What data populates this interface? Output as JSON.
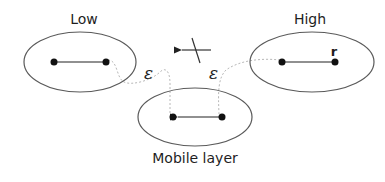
{
  "diagram": {
    "nodes": [
      {
        "id": "low",
        "label": "Low"
      },
      {
        "id": "high",
        "label": "High",
        "point_label": "r"
      },
      {
        "id": "mobile",
        "label": "Mobile layer"
      }
    ],
    "edge_labels": {
      "left": "ε",
      "right": "ε"
    },
    "colors": {
      "stroke": "#5a5a5a",
      "dot": "#111111",
      "dotted": "#b0b0b0",
      "text": "#1e1e1e"
    }
  }
}
